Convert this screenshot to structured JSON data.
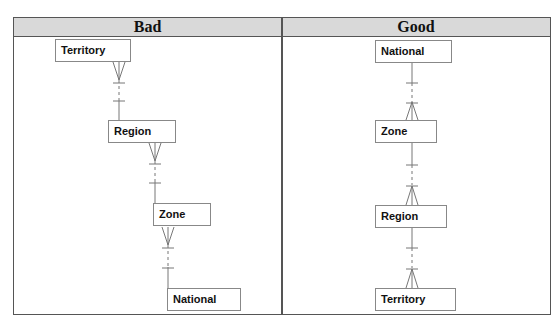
{
  "table": {
    "headers": [
      {
        "label": "Bad"
      },
      {
        "label": "Good"
      }
    ],
    "header_bg": "#d9d9d9"
  },
  "bad": {
    "entities": [
      {
        "label": "Territory"
      },
      {
        "label": "Region"
      },
      {
        "label": "Zone"
      },
      {
        "label": "National"
      }
    ],
    "relationship_notation": "many (crow's foot) at upper entity, one (bar) at lower entity, dashed optional segment"
  },
  "good": {
    "entities": [
      {
        "label": "National"
      },
      {
        "label": "Zone"
      },
      {
        "label": "Region"
      },
      {
        "label": "Territory"
      }
    ],
    "relationship_notation": "one (bar) at upper entity, many (crow's foot) at lower entity, dashed optional segment"
  }
}
